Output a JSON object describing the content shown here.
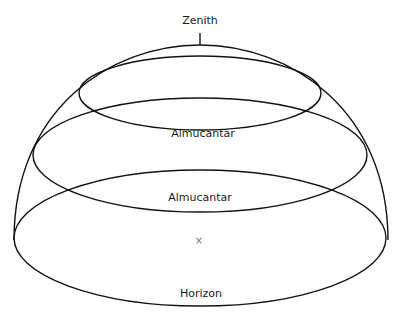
{
  "diagram": {
    "labels": {
      "zenith": "Zenith",
      "almucantar_upper": "Almucantar",
      "almucantar_lower": "Almucantar",
      "horizon": "Horizon",
      "observer_mark": "×"
    },
    "colors": {
      "line": "#111111",
      "text": "#1a1a1a",
      "mark": "#777777",
      "background": "#ffffff"
    }
  }
}
